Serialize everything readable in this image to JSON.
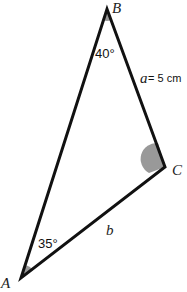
{
  "diagram": {
    "type": "triangle",
    "vertices": {
      "A": {
        "label": "A",
        "x": 21,
        "y": 278
      },
      "B": {
        "label": "B",
        "x": 107,
        "y": 9
      },
      "C": {
        "label": "C",
        "x": 165,
        "y": 167
      }
    },
    "angles": {
      "A": "35°",
      "B": "40°"
    },
    "sides": {
      "a": {
        "var": "a",
        "value": "= 5 cm"
      },
      "b": {
        "var": "b"
      }
    },
    "colors": {
      "stroke": "#111111",
      "angle_fill": "#999999"
    }
  }
}
